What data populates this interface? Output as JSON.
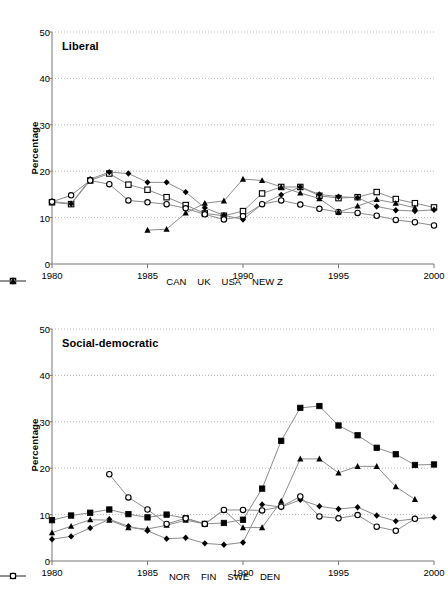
{
  "page": {
    "header_note": ""
  },
  "axis": {
    "ylabel": "Percentage",
    "yticks": [
      0,
      10,
      20,
      30,
      40,
      50
    ],
    "xticks": [
      1980,
      1985,
      1990,
      1995,
      2000
    ],
    "ylim": [
      0,
      50
    ],
    "xlim": [
      1980,
      2000
    ],
    "grid": "horizontal-dotted"
  },
  "charts": [
    {
      "id": "liberal",
      "title": "Liberal",
      "legend": [
        {
          "label": "CAN",
          "marker": "open-square"
        },
        {
          "label": "UK",
          "marker": "filled-diamond"
        },
        {
          "label": "USA",
          "marker": "open-circle"
        },
        {
          "label": "NEW Z",
          "marker": "filled-triangle"
        }
      ]
    },
    {
      "id": "socdem",
      "title": "Social-democratic",
      "legend": [
        {
          "label": "NOR",
          "marker": "filled-diamond"
        },
        {
          "label": "FIN",
          "marker": "filled-square"
        },
        {
          "label": "SWE",
          "marker": "filled-triangle"
        },
        {
          "label": "DEN",
          "marker": "open-circle"
        }
      ]
    }
  ],
  "chart_data": [
    {
      "type": "line",
      "title": "Liberal",
      "xlabel": "",
      "ylabel": "Percentage",
      "xlim": [
        1980,
        2000
      ],
      "ylim": [
        0,
        50
      ],
      "grid": true,
      "legend_position": "bottom",
      "x": [
        1980,
        1981,
        1982,
        1983,
        1984,
        1985,
        1986,
        1987,
        1988,
        1989,
        1990,
        1991,
        1992,
        1993,
        1994,
        1995,
        1996,
        1997,
        1998,
        1999,
        2000
      ],
      "series": [
        {
          "name": "CAN",
          "marker": "open-square",
          "values": [
            13.3,
            12.9,
            18.0,
            19.5,
            17.1,
            16.0,
            14.4,
            12.7,
            10.9,
            10.4,
            11.4,
            15.2,
            16.6,
            16.6,
            14.7,
            14.2,
            14.4,
            15.5,
            14.0,
            13.1,
            12.2
          ]
        },
        {
          "name": "UK",
          "marker": "filled-diamond",
          "values": [
            13.5,
            13.0,
            18.3,
            19.8,
            19.5,
            17.6,
            17.6,
            15.5,
            12.1,
            10.5,
            9.6,
            12.9,
            14.9,
            16.6,
            15.0,
            14.5,
            14.3,
            12.4,
            11.6,
            11.4,
            11.7
          ]
        },
        {
          "name": "USA",
          "marker": "open-circle",
          "values": [
            13.4,
            14.8,
            18.0,
            17.2,
            13.7,
            13.3,
            12.9,
            12.0,
            10.7,
            9.6,
            10.3,
            12.9,
            13.7,
            12.8,
            11.9,
            11.2,
            11.0,
            10.4,
            9.5,
            9.0,
            8.3
          ]
        },
        {
          "name": "NEW Z",
          "marker": "filled-triangle",
          "values": [
            null,
            null,
            null,
            null,
            null,
            7.3,
            7.5,
            11.0,
            13.1,
            13.6,
            18.3,
            18.0,
            16.6,
            15.3,
            14.1,
            11.2,
            12.5,
            13.9,
            13.1,
            12.1,
            null
          ]
        }
      ]
    },
    {
      "type": "line",
      "title": "Social-democratic",
      "xlabel": "",
      "ylabel": "Percentage",
      "xlim": [
        1980,
        2000
      ],
      "ylim": [
        0,
        50
      ],
      "grid": true,
      "legend_position": "bottom",
      "x": [
        1980,
        1981,
        1982,
        1983,
        1984,
        1985,
        1986,
        1987,
        1988,
        1989,
        1990,
        1991,
        1992,
        1993,
        1994,
        1995,
        1996,
        1997,
        1998,
        1999,
        2000
      ],
      "series": [
        {
          "name": "NOR",
          "marker": "filled-diamond",
          "values": [
            4.7,
            5.3,
            7.1,
            9.0,
            7.5,
            6.5,
            4.8,
            5.0,
            3.8,
            3.5,
            4.0,
            12.2,
            11.6,
            13.2,
            11.8,
            11.2,
            11.6,
            9.8,
            8.6,
            9.1,
            9.4
          ]
        },
        {
          "name": "FIN",
          "marker": "filled-square",
          "values": [
            8.8,
            9.8,
            10.4,
            11.1,
            10.1,
            9.4,
            10.0,
            9.2,
            8.0,
            8.2,
            8.9,
            15.6,
            25.9,
            33.0,
            33.4,
            29.2,
            27.1,
            24.4,
            23.0,
            20.7,
            20.8
          ]
        },
        {
          "name": "SWE",
          "marker": "filled-triangle",
          "values": [
            6.1,
            7.5,
            8.9,
            8.8,
            7.2,
            6.9,
            7.7,
            8.8,
            8.0,
            11.0,
            7.2,
            7.2,
            12.9,
            22.0,
            22.0,
            19.0,
            20.4,
            20.4,
            16.0,
            13.3,
            null
          ]
        },
        {
          "name": "DEN",
          "marker": "open-circle",
          "values": [
            null,
            null,
            null,
            18.7,
            13.7,
            11.1,
            8.0,
            9.2,
            8.0,
            11.0,
            11.0,
            10.9,
            11.7,
            13.9,
            9.6,
            9.2,
            9.9,
            7.4,
            6.5,
            9.1,
            null
          ]
        }
      ]
    }
  ]
}
